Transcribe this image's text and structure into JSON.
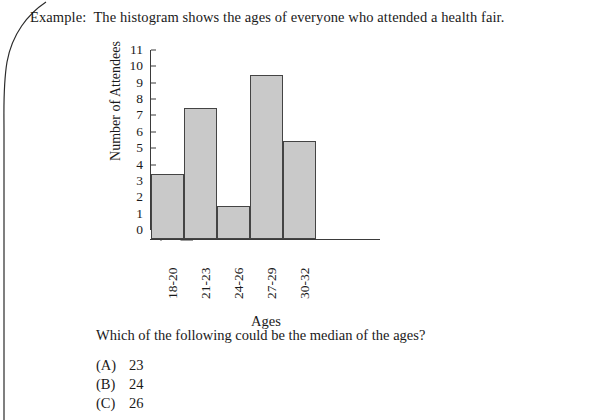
{
  "document": {
    "prompt_lead": "Example:",
    "prompt_text": "The histogram shows the ages of everyone who attended a health fair.",
    "question": "Which of the following could be the median of the ages?",
    "choices": [
      {
        "tag": "(A)",
        "value": "23"
      },
      {
        "tag": "(B)",
        "value": "24"
      },
      {
        "tag": "(C)",
        "value": "26"
      }
    ]
  },
  "chart_data": {
    "type": "bar",
    "title": "",
    "categories": [
      "18-20",
      "21-23",
      "24-26",
      "27-29",
      "30-32"
    ],
    "values": [
      4,
      8,
      2,
      10,
      6
    ],
    "xlabel": "Ages",
    "ylabel": "Number of Attendees",
    "ylim": [
      0,
      11
    ],
    "yticks": [
      0,
      1,
      2,
      3,
      4,
      5,
      6,
      7,
      8,
      9,
      10,
      11
    ],
    "ytick_labels": [
      "0",
      "1",
      "2",
      "3",
      "4",
      "5",
      "6",
      "7",
      "8",
      "9",
      "10",
      "11"
    ],
    "grid": false,
    "legend": false,
    "axis_break": true,
    "bar_fill_color": "#c9c9c9",
    "bar_edge_color": "#444444"
  }
}
